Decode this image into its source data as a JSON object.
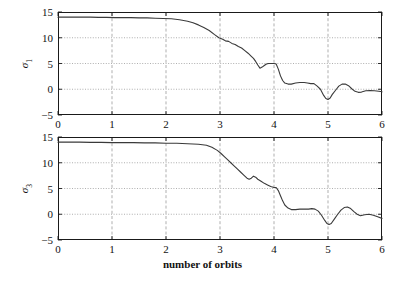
{
  "figure": {
    "xlabel": "number of orbits",
    "background": "#ffffff",
    "line_color": "#3a3a3a",
    "grid_color": "#8c8c8c",
    "axis_color": "#1a1a1a"
  },
  "panels": [
    {
      "id": "top",
      "ylabel_main": "σ",
      "ylabel_sub": "1",
      "yticks": [
        "15",
        "10",
        "5",
        "0",
        "−5"
      ],
      "xticks": [
        "0",
        "1",
        "2",
        "3",
        "4",
        "5",
        "6"
      ]
    },
    {
      "id": "bottom",
      "ylabel_main": "σ",
      "ylabel_sub": "3",
      "yticks": [
        "15",
        "10",
        "5",
        "0",
        "−5"
      ],
      "xticks": [
        "0",
        "1",
        "2",
        "3",
        "4",
        "5",
        "6"
      ]
    }
  ],
  "chart_data": [
    {
      "type": "line",
      "id": "sigma1-plot",
      "title": "",
      "xlabel": "number of orbits",
      "ylabel": "σ₁",
      "xlim": [
        0,
        6
      ],
      "ylim": [
        -5,
        15
      ],
      "xticks": [
        0,
        1,
        2,
        3,
        4,
        5,
        6
      ],
      "yticks": [
        -5,
        0,
        5,
        10,
        15
      ],
      "grid": true,
      "grid_vertical_at": [
        1,
        2,
        3,
        4,
        5
      ],
      "grid_horizontal_at": [
        0,
        5,
        10
      ],
      "legend": null,
      "series": [
        {
          "name": "sigma_1",
          "x": [
            0.0,
            0.15,
            0.3,
            0.45,
            0.6,
            0.75,
            0.9,
            1.05,
            1.2,
            1.35,
            1.5,
            1.65,
            1.8,
            1.95,
            2.1,
            2.25,
            2.4,
            2.5,
            2.6,
            2.7,
            2.8,
            2.9,
            2.98,
            3.05,
            3.1,
            3.16,
            3.22,
            3.28,
            3.34,
            3.4,
            3.46,
            3.52,
            3.58,
            3.62,
            3.66,
            3.7,
            3.74,
            3.78,
            3.82,
            3.86,
            3.9,
            3.95,
            4.0,
            4.04,
            4.08,
            4.12,
            4.16,
            4.2,
            4.26,
            4.32,
            4.4,
            4.48,
            4.56,
            4.62,
            4.68,
            4.74,
            4.8,
            4.86,
            4.92,
            4.96,
            5.0,
            5.04,
            5.08,
            5.14,
            5.2,
            5.26,
            5.32,
            5.38,
            5.44,
            5.5,
            5.56,
            5.62,
            5.7,
            5.78,
            5.86,
            5.94,
            6.0
          ],
          "y": [
            14.0,
            14.0,
            14.0,
            14.0,
            14.0,
            13.95,
            13.95,
            13.9,
            13.9,
            13.9,
            13.85,
            13.85,
            13.8,
            13.75,
            13.7,
            13.5,
            13.2,
            12.9,
            12.5,
            12.0,
            11.4,
            10.6,
            10.0,
            9.7,
            9.4,
            9.3,
            8.9,
            8.7,
            8.3,
            8.0,
            7.5,
            7.0,
            6.4,
            6.0,
            5.4,
            4.7,
            4.1,
            4.3,
            4.6,
            4.9,
            5.0,
            5.0,
            5.0,
            4.9,
            3.9,
            2.6,
            1.7,
            1.2,
            1.0,
            1.0,
            1.2,
            1.3,
            1.3,
            1.2,
            1.1,
            1.1,
            0.6,
            0.0,
            -1.2,
            -1.8,
            -2.0,
            -1.7,
            -1.0,
            -0.2,
            0.6,
            1.0,
            1.0,
            0.7,
            0.1,
            -0.4,
            -0.6,
            -0.55,
            -0.3,
            -0.25,
            -0.3,
            -0.4,
            -0.5
          ]
        }
      ]
    },
    {
      "type": "line",
      "id": "sigma3-plot",
      "title": "",
      "xlabel": "number of orbits",
      "ylabel": "σ₃",
      "xlim": [
        0,
        6
      ],
      "ylim": [
        -5,
        15
      ],
      "xticks": [
        0,
        1,
        2,
        3,
        4,
        5,
        6
      ],
      "yticks": [
        -5,
        0,
        5,
        10,
        15
      ],
      "grid": true,
      "grid_vertical_at": [
        1,
        2,
        3,
        4,
        5
      ],
      "grid_horizontal_at": [
        0,
        5,
        10
      ],
      "legend": null,
      "series": [
        {
          "name": "sigma_3",
          "x": [
            0.0,
            0.2,
            0.4,
            0.6,
            0.8,
            1.0,
            1.2,
            1.4,
            1.6,
            1.8,
            2.0,
            2.2,
            2.4,
            2.6,
            2.75,
            2.85,
            2.95,
            3.02,
            3.08,
            3.14,
            3.2,
            3.26,
            3.32,
            3.38,
            3.44,
            3.5,
            3.54,
            3.58,
            3.62,
            3.66,
            3.7,
            3.76,
            3.82,
            3.88,
            3.94,
            4.0,
            4.04,
            4.08,
            4.12,
            4.16,
            4.2,
            4.26,
            4.32,
            4.4,
            4.48,
            4.56,
            4.64,
            4.7,
            4.76,
            4.82,
            4.88,
            4.94,
            4.98,
            5.02,
            5.06,
            5.12,
            5.18,
            5.24,
            5.3,
            5.36,
            5.42,
            5.48,
            5.54,
            5.6,
            5.68,
            5.76,
            5.84,
            5.92,
            6.0
          ],
          "y": [
            14.0,
            14.0,
            14.0,
            13.95,
            13.95,
            13.9,
            13.9,
            13.9,
            13.85,
            13.85,
            13.8,
            13.8,
            13.7,
            13.6,
            13.4,
            13.0,
            12.4,
            11.8,
            11.2,
            10.6,
            10.0,
            9.4,
            8.8,
            8.2,
            7.6,
            7.0,
            6.8,
            7.0,
            7.4,
            7.2,
            6.8,
            6.4,
            6.0,
            5.7,
            5.4,
            5.2,
            5.2,
            4.6,
            3.6,
            2.6,
            1.8,
            1.2,
            0.9,
            0.9,
            1.0,
            1.0,
            1.0,
            1.1,
            1.0,
            0.6,
            -0.2,
            -1.2,
            -1.8,
            -2.0,
            -1.8,
            -0.9,
            0.0,
            0.8,
            1.3,
            1.4,
            1.1,
            0.5,
            0.0,
            -0.3,
            -0.1,
            0.0,
            -0.2,
            -0.5,
            -0.8
          ]
        }
      ]
    }
  ]
}
